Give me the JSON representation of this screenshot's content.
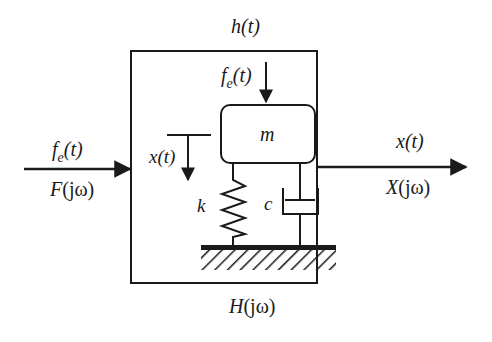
{
  "diagram": {
    "type": "block-diagram",
    "colors": {
      "ink": "#1a1a1a",
      "background": "#ffffff"
    },
    "block": {
      "time_label_base": "h",
      "time_label_arg": "(t)",
      "freq_label_base": "H",
      "freq_label_arg": "(jω)"
    },
    "input": {
      "time_base": "f",
      "time_sub": "e",
      "time_arg": "(t)",
      "freq_base": "F",
      "freq_arg": "(jω)"
    },
    "output": {
      "time_base": "x",
      "time_arg": "(t)",
      "freq_base": "X",
      "freq_arg": "(jω)"
    },
    "mechanism": {
      "force_base": "f",
      "force_sub": "e",
      "force_arg": "(t)",
      "mass_label": "m",
      "spring_label": "k",
      "damper_label": "c",
      "displacement_base": "x",
      "displacement_arg": "(t)"
    }
  }
}
